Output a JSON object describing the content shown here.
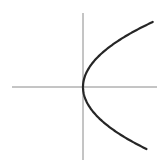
{
  "figure": {
    "title": "",
    "background_color": "#ffffff",
    "width": 165,
    "height": 164
  },
  "chart_data": {
    "type": "line",
    "title": "",
    "subtitle": "",
    "xlabel": "",
    "ylabel": "",
    "grid": false,
    "legend": false,
    "legend_position": "none",
    "description": "Sideways parabola opening to the right with vertex at the origin, drawn over unlabeled x and y axes",
    "axes": {
      "origin_px": [
        83,
        87
      ],
      "x_axis": {
        "name": "x-axis",
        "orientation": "horizontal",
        "y_px": 87,
        "x_start_px": 12,
        "x_end_px": 157,
        "color": "#8a8a8a",
        "width_px": 1,
        "ticks": [],
        "tick_labels": [],
        "arrowheads": false
      },
      "y_axis": {
        "name": "y-axis",
        "orientation": "vertical",
        "x_px": 83,
        "y_start_px": 13,
        "y_end_px": 160,
        "color": "#8a8a8a",
        "width_px": 1,
        "ticks": [],
        "tick_labels": [],
        "arrowheads": false
      }
    },
    "series": [
      {
        "name": "parabola",
        "equation": "x = k*y^2 (opens right)",
        "curve_type": "parabola",
        "opens": "right",
        "vertex_px": [
          83,
          87
        ],
        "k_px": 0.0165,
        "color": "#262626",
        "width_px": 2.2,
        "points_px": [
          [
            152,
            22
          ],
          [
            143,
            31
          ],
          [
            134,
            39
          ],
          [
            125,
            47
          ],
          [
            113,
            40
          ],
          [
            113,
            57
          ],
          [
            104,
            64
          ],
          [
            97,
            55
          ],
          [
            97,
            70
          ],
          [
            92,
            62
          ],
          [
            92,
            76
          ],
          [
            87,
            80
          ],
          [
            83,
            87
          ],
          [
            87,
            94
          ],
          [
            92,
            98
          ],
          [
            92,
            112
          ],
          [
            97,
            104
          ],
          [
            97,
            119
          ],
          [
            104,
            110
          ],
          [
            113,
            117
          ],
          [
            113,
            134
          ],
          [
            125,
            127
          ],
          [
            134,
            135
          ],
          [
            143,
            143
          ],
          [
            153,
            149
          ]
        ],
        "endpoint_top_px": [
          152,
          22
        ],
        "endpoint_bottom_px": [
          153,
          149
        ]
      }
    ],
    "xlim_px": [
      12,
      157
    ],
    "ylim_px": [
      13,
      160
    ],
    "annotations": []
  }
}
